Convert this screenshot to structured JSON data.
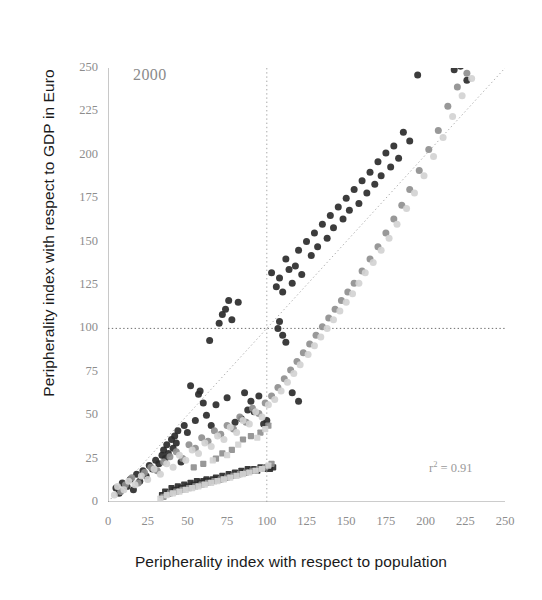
{
  "chart_data": {
    "type": "scatter",
    "title": "",
    "xlabel": "Peripherality index with respect to population",
    "ylabel": "Peripherality index with respect to GDP in Euro",
    "xlim": [
      0,
      250
    ],
    "ylim": [
      0,
      250
    ],
    "xticks": [
      0,
      25,
      50,
      75,
      100,
      125,
      150,
      175,
      200,
      225,
      250
    ],
    "yticks": [
      0,
      25,
      50,
      75,
      100,
      125,
      150,
      175,
      200,
      225,
      250
    ],
    "grid": false,
    "legend": "none",
    "annotations": [
      {
        "name": "year-label",
        "text": "2000",
        "x": 14,
        "y": 242
      },
      {
        "name": "r-squared-label",
        "text": "r² =  0.91",
        "value": 0.91,
        "x": 208,
        "y": 17
      }
    ],
    "reference_lines": [
      {
        "name": "identity-line",
        "kind": "diagonal",
        "from": [
          0,
          0
        ],
        "to": [
          250,
          250
        ],
        "style": "dotted",
        "color": "#b0b0b0"
      },
      {
        "name": "vertical-100-line",
        "kind": "vertical",
        "at": 100,
        "style": "dotted",
        "color": "#a8a8a8"
      },
      {
        "name": "horizontal-100-line",
        "kind": "horizontal",
        "at": 100,
        "style": "dotted",
        "color": "#6f6f6f"
      }
    ],
    "marker_colors": {
      "dark": "#2b2b2b",
      "mid": "#8f8f8f",
      "light": "#d2d2d2"
    },
    "series": [
      {
        "name": "upper-branch-dark",
        "color": "#2b2b2b",
        "marker": "circle",
        "points": [
          [
            5,
            8
          ],
          [
            7,
            5
          ],
          [
            9,
            11
          ],
          [
            12,
            9
          ],
          [
            14,
            13
          ],
          [
            16,
            7
          ],
          [
            18,
            16
          ],
          [
            20,
            12
          ],
          [
            22,
            18
          ],
          [
            24,
            15
          ],
          [
            26,
            21
          ],
          [
            28,
            19
          ],
          [
            30,
            24
          ],
          [
            32,
            22
          ],
          [
            34,
            27
          ],
          [
            35,
            30
          ],
          [
            36,
            25
          ],
          [
            37,
            33
          ],
          [
            38,
            28
          ],
          [
            40,
            36
          ],
          [
            41,
            31
          ],
          [
            42,
            38
          ],
          [
            43,
            34
          ],
          [
            44,
            41
          ],
          [
            46,
            23
          ],
          [
            48,
            44
          ],
          [
            50,
            40
          ],
          [
            52,
            67
          ],
          [
            55,
            47
          ],
          [
            57,
            62
          ],
          [
            58,
            64
          ],
          [
            60,
            57
          ],
          [
            62,
            50
          ],
          [
            64,
            93
          ],
          [
            65,
            44
          ],
          [
            68,
            56
          ],
          [
            70,
            103
          ],
          [
            72,
            108
          ],
          [
            74,
            111
          ],
          [
            75,
            60
          ],
          [
            76,
            116
          ],
          [
            78,
            105
          ],
          [
            80,
            46
          ],
          [
            82,
            115
          ],
          [
            84,
            48
          ],
          [
            86,
            63
          ],
          [
            88,
            53
          ],
          [
            90,
            58
          ],
          [
            92,
            52
          ],
          [
            95,
            61
          ],
          [
            98,
            45
          ],
          [
            100,
            47
          ],
          [
            103,
            132
          ],
          [
            106,
            124
          ],
          [
            108,
            129
          ],
          [
            110,
            121
          ],
          [
            112,
            140
          ],
          [
            114,
            134
          ],
          [
            116,
            126
          ],
          [
            118,
            136
          ],
          [
            120,
            145
          ],
          [
            122,
            131
          ],
          [
            125,
            150
          ],
          [
            128,
            142
          ],
          [
            130,
            155
          ],
          [
            132,
            147
          ],
          [
            135,
            160
          ],
          [
            138,
            152
          ],
          [
            140,
            165
          ],
          [
            142,
            158
          ],
          [
            145,
            170
          ],
          [
            148,
            163
          ],
          [
            150,
            175
          ],
          [
            152,
            168
          ],
          [
            155,
            180
          ],
          [
            158,
            172
          ],
          [
            160,
            185
          ],
          [
            163,
            178
          ],
          [
            165,
            190
          ],
          [
            168,
            183
          ],
          [
            170,
            196
          ],
          [
            172,
            188
          ],
          [
            175,
            201
          ],
          [
            178,
            193
          ],
          [
            180,
            205
          ],
          [
            183,
            198
          ],
          [
            186,
            213
          ],
          [
            190,
            208
          ],
          [
            195,
            246
          ],
          [
            200,
            252
          ],
          [
            205,
            258
          ],
          [
            208,
            264
          ],
          [
            212,
            261
          ],
          [
            215,
            255
          ],
          [
            218,
            249
          ],
          [
            222,
            251
          ],
          [
            226,
            243
          ]
        ]
      },
      {
        "name": "upper-branch-mid",
        "color": "#8f8f8f",
        "marker": "circle",
        "points": [
          [
            8,
            6
          ],
          [
            11,
            10
          ],
          [
            15,
            14
          ],
          [
            19,
            11
          ],
          [
            23,
            17
          ],
          [
            27,
            20
          ],
          [
            31,
            18
          ],
          [
            35,
            23
          ],
          [
            39,
            26
          ],
          [
            43,
            29
          ],
          [
            47,
            25
          ],
          [
            51,
            33
          ],
          [
            55,
            31
          ],
          [
            59,
            37
          ],
          [
            63,
            35
          ],
          [
            67,
            41
          ],
          [
            71,
            39
          ],
          [
            75,
            44
          ],
          [
            79,
            42
          ],
          [
            83,
            49
          ],
          [
            87,
            46
          ],
          [
            91,
            54
          ],
          [
            95,
            51
          ],
          [
            99,
            57
          ],
          [
            103,
            61
          ],
          [
            107,
            66
          ],
          [
            111,
            71
          ],
          [
            115,
            76
          ],
          [
            119,
            81
          ],
          [
            123,
            86
          ],
          [
            127,
            91
          ],
          [
            131,
            96
          ],
          [
            135,
            101
          ],
          [
            139,
            106
          ],
          [
            143,
            111
          ],
          [
            147,
            116
          ],
          [
            151,
            121
          ],
          [
            155,
            126
          ],
          [
            160,
            133
          ],
          [
            165,
            140
          ],
          [
            170,
            147
          ],
          [
            175,
            155
          ],
          [
            180,
            163
          ],
          [
            185,
            171
          ],
          [
            190,
            180
          ],
          [
            196,
            191
          ],
          [
            202,
            203
          ],
          [
            208,
            214
          ],
          [
            214,
            228
          ],
          [
            220,
            239
          ],
          [
            226,
            247
          ],
          [
            232,
            255
          ]
        ]
      },
      {
        "name": "upper-branch-light",
        "color": "#d2d2d2",
        "marker": "circle",
        "points": [
          [
            4,
            4
          ],
          [
            6,
            9
          ],
          [
            10,
            7
          ],
          [
            13,
            12
          ],
          [
            17,
            10
          ],
          [
            21,
            15
          ],
          [
            25,
            13
          ],
          [
            29,
            19
          ],
          [
            33,
            16
          ],
          [
            37,
            22
          ],
          [
            41,
            20
          ],
          [
            45,
            27
          ],
          [
            49,
            24
          ],
          [
            53,
            30
          ],
          [
            57,
            28
          ],
          [
            61,
            34
          ],
          [
            65,
            32
          ],
          [
            69,
            38
          ],
          [
            73,
            36
          ],
          [
            77,
            43
          ],
          [
            81,
            40
          ],
          [
            85,
            47
          ],
          [
            89,
            45
          ],
          [
            93,
            52
          ],
          [
            97,
            49
          ],
          [
            101,
            56
          ],
          [
            105,
            59
          ],
          [
            109,
            64
          ],
          [
            113,
            69
          ],
          [
            117,
            74
          ],
          [
            121,
            79
          ],
          [
            126,
            85
          ],
          [
            130,
            90
          ],
          [
            134,
            95
          ],
          [
            138,
            100
          ],
          [
            142,
            105
          ],
          [
            146,
            110
          ],
          [
            150,
            115
          ],
          [
            154,
            120
          ],
          [
            158,
            126
          ],
          [
            162,
            132
          ],
          [
            167,
            138
          ],
          [
            172,
            145
          ],
          [
            177,
            152
          ],
          [
            182,
            160
          ],
          [
            188,
            169
          ],
          [
            193,
            178
          ],
          [
            199,
            188
          ],
          [
            205,
            199
          ],
          [
            211,
            210
          ],
          [
            217,
            222
          ],
          [
            223,
            234
          ],
          [
            229,
            244
          ],
          [
            235,
            252
          ],
          [
            241,
            259
          ]
        ]
      },
      {
        "name": "lower-branch-dark",
        "color": "#2b2b2b",
        "marker": "square",
        "points": [
          [
            34,
            4
          ],
          [
            36,
            6
          ],
          [
            38,
            5
          ],
          [
            40,
            8
          ],
          [
            42,
            7
          ],
          [
            44,
            9
          ],
          [
            46,
            8
          ],
          [
            48,
            10
          ],
          [
            50,
            9
          ],
          [
            52,
            11
          ],
          [
            54,
            10
          ],
          [
            56,
            12
          ],
          [
            58,
            11
          ],
          [
            60,
            12
          ],
          [
            62,
            13
          ],
          [
            64,
            12
          ],
          [
            66,
            13
          ],
          [
            68,
            14
          ],
          [
            70,
            13
          ],
          [
            72,
            15
          ],
          [
            74,
            14
          ],
          [
            76,
            16
          ],
          [
            78,
            15
          ],
          [
            80,
            17
          ],
          [
            82,
            16
          ],
          [
            84,
            18
          ],
          [
            86,
            17
          ],
          [
            88,
            19
          ],
          [
            90,
            18
          ],
          [
            92,
            19
          ],
          [
            94,
            18
          ],
          [
            96,
            20
          ],
          [
            98,
            19
          ],
          [
            100,
            20
          ],
          [
            102,
            19
          ],
          [
            104,
            20
          ]
        ]
      },
      {
        "name": "lower-branch-mid",
        "color": "#8f8f8f",
        "marker": "square",
        "points": [
          [
            35,
            3
          ],
          [
            39,
            5
          ],
          [
            43,
            6
          ],
          [
            47,
            7
          ],
          [
            51,
            8
          ],
          [
            55,
            9
          ],
          [
            59,
            10
          ],
          [
            63,
            11
          ],
          [
            67,
            12
          ],
          [
            71,
            13
          ],
          [
            75,
            14
          ],
          [
            79,
            15
          ],
          [
            83,
            16
          ],
          [
            87,
            17
          ],
          [
            91,
            18
          ],
          [
            95,
            19
          ],
          [
            99,
            20
          ],
          [
            103,
            22
          ],
          [
            72,
            28
          ],
          [
            78,
            30
          ],
          [
            85,
            36
          ],
          [
            90,
            38
          ],
          [
            96,
            40
          ],
          [
            101,
            44
          ],
          [
            68,
            25
          ],
          [
            60,
            22
          ],
          [
            54,
            20
          ]
        ]
      },
      {
        "name": "lower-branch-light",
        "color": "#d2d2d2",
        "marker": "square",
        "points": [
          [
            33,
            2
          ],
          [
            37,
            4
          ],
          [
            41,
            5
          ],
          [
            45,
            6
          ],
          [
            49,
            7
          ],
          [
            53,
            8
          ],
          [
            57,
            9
          ],
          [
            61,
            10
          ],
          [
            65,
            11
          ],
          [
            69,
            12
          ],
          [
            73,
            13
          ],
          [
            77,
            14
          ],
          [
            81,
            15
          ],
          [
            85,
            16
          ],
          [
            89,
            17
          ],
          [
            93,
            18
          ],
          [
            97,
            19
          ],
          [
            101,
            21
          ],
          [
            66,
            24
          ],
          [
            75,
            27
          ],
          [
            82,
            33
          ],
          [
            94,
            37
          ],
          [
            99,
            42
          ]
        ]
      },
      {
        "name": "right-outliers-dark",
        "color": "#2b2b2b",
        "marker": "circle",
        "points": [
          [
            108,
            104
          ],
          [
            110,
            96
          ],
          [
            112,
            92
          ],
          [
            116,
            63
          ],
          [
            120,
            58
          ],
          [
            107,
            100
          ]
        ]
      }
    ]
  }
}
